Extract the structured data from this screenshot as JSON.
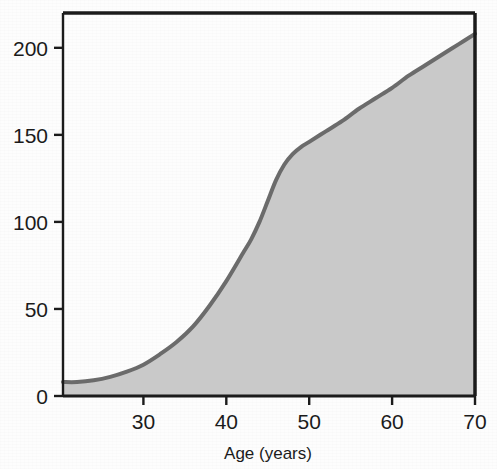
{
  "figure": {
    "background_color": "#ffffff",
    "width": 497,
    "height": 469
  },
  "chart_data": {
    "type": "area",
    "title": "",
    "subtitle": "",
    "xlabel": "Age  (years)",
    "ylabel": "",
    "xlim": [
      20.3,
      70
    ],
    "ylim": [
      0,
      220
    ],
    "xticks": [
      30,
      40,
      50,
      60,
      70
    ],
    "xtick_labels": [
      "30",
      "40",
      "50",
      "60",
      "70"
    ],
    "yticks": [
      0,
      50,
      100,
      150,
      200
    ],
    "ytick_labels": [
      "0",
      "50",
      "100",
      "150",
      "200"
    ],
    "grid": false,
    "legend": null,
    "legend_position": "none",
    "frame": "box",
    "line_color": "#6b6b6b",
    "fill_color": "#c9c9c9",
    "axis_color": "#1b1b1b",
    "line_width": 4,
    "x": [
      20.3,
      22,
      24,
      26,
      28,
      30,
      32,
      34,
      36,
      38,
      40,
      42,
      43,
      44,
      45,
      46,
      47,
      48,
      49,
      50,
      52,
      54,
      56,
      58,
      60,
      62,
      64,
      66,
      68,
      70
    ],
    "y": [
      8,
      8,
      9,
      11,
      14,
      18,
      24,
      31,
      40,
      52,
      66,
      82,
      90,
      100,
      112,
      124,
      133,
      139,
      143,
      146,
      152,
      158,
      165,
      171,
      177,
      184,
      190,
      196,
      202,
      208
    ],
    "series": [
      {
        "name": "Cumulative value by age",
        "values": [
          8,
          8,
          9,
          11,
          14,
          18,
          24,
          31,
          40,
          52,
          66,
          82,
          90,
          100,
          112,
          124,
          133,
          139,
          143,
          146,
          152,
          158,
          165,
          171,
          177,
          184,
          190,
          196,
          202,
          208
        ]
      }
    ],
    "annotations": []
  }
}
